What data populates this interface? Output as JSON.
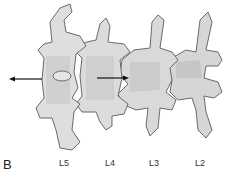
{
  "figure": {
    "panel_label": "B",
    "vertebra_labels": [
      "L5",
      "L4",
      "L3",
      "L2"
    ],
    "arrows": [
      {
        "name": "left-arrow",
        "direction": "left"
      },
      {
        "name": "right-arrow",
        "direction": "right"
      }
    ],
    "colors": {
      "bone_fill": "#d9d9d9",
      "bone_shadow": "#b8b8b8",
      "outline": "#6a6a6a",
      "arrow": "#111111"
    }
  }
}
